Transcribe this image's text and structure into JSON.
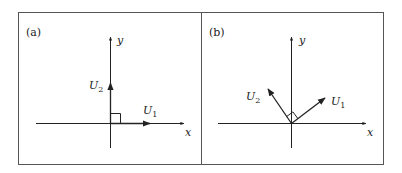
{
  "figure": {
    "panels": [
      {
        "label": "(a)",
        "x_axis_label": "x",
        "y_axis_label": "y",
        "vectors": [
          {
            "name": "U",
            "subscript": "1",
            "direction": "along +x axis"
          },
          {
            "name": "U",
            "subscript": "2",
            "direction": "along +y axis"
          }
        ],
        "right_angle_marker": true
      },
      {
        "label": "(b)",
        "x_axis_label": "x",
        "y_axis_label": "y",
        "vectors": [
          {
            "name": "U",
            "subscript": "1",
            "direction": "rotated ~35° counter-clockwise from +x"
          },
          {
            "name": "U",
            "subscript": "2",
            "direction": "rotated ~35° counter-clockwise from +y"
          }
        ],
        "right_angle_marker": true
      }
    ],
    "colors": {
      "line": "#222222",
      "frame": "#555555",
      "background": "#ffffff"
    }
  }
}
